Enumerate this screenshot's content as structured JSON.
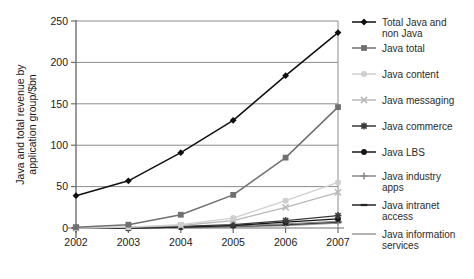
{
  "chart_data": {
    "type": "line",
    "title": "",
    "xlabel": "",
    "ylabel": "Java and total revenue by application group/$bn",
    "categories": [
      "2002",
      "2003",
      "2004",
      "2005",
      "2006",
      "2007"
    ],
    "x": [
      2002,
      2003,
      2004,
      2005,
      2006,
      2007
    ],
    "ylim": [
      0,
      250
    ],
    "yticks": [
      0,
      50,
      100,
      150,
      200,
      250
    ],
    "ytick_labels": [
      "0",
      "50",
      "100",
      "150",
      "200",
      "250"
    ],
    "grid": true,
    "grid_axis": "y",
    "legend_position": "right",
    "series": [
      {
        "name": "Total Java and non Java",
        "label_lines": [
          "Total Java and",
          "non Java"
        ],
        "marker": "diamond",
        "color": "#101010",
        "values": [
          39,
          57,
          91,
          130,
          184,
          236
        ]
      },
      {
        "name": "Java total",
        "label_lines": [
          "Java total"
        ],
        "marker": "square",
        "color": "#707070",
        "values": [
          1,
          4,
          16,
          40,
          85,
          146
        ]
      },
      {
        "name": "Java content",
        "label_lines": [
          "Java content"
        ],
        "marker": "circle",
        "color": "#cfcfcf",
        "values": [
          0,
          1,
          4,
          12,
          33,
          55
        ]
      },
      {
        "name": "Java messaging",
        "label_lines": [
          "Java messaging"
        ],
        "marker": "x",
        "color": "#b8b8b8",
        "values": [
          0,
          1,
          3,
          9,
          25,
          43
        ]
      },
      {
        "name": "Java commerce",
        "label_lines": [
          "Java commerce"
        ],
        "marker": "star",
        "color": "#3a3a3a",
        "values": [
          0,
          0,
          2,
          4,
          9,
          15
        ]
      },
      {
        "name": "Java LBS",
        "label_lines": [
          "Java LBS"
        ],
        "marker": "dot",
        "color": "#161616",
        "values": [
          0,
          0,
          1,
          3,
          7,
          11
        ]
      },
      {
        "name": "Java industry apps",
        "label_lines": [
          "Java industry",
          "apps"
        ],
        "marker": "plus",
        "color": "#8a8a8a",
        "values": [
          0,
          0,
          1,
          2,
          5,
          8
        ]
      },
      {
        "name": "Java intranet access",
        "label_lines": [
          "Java intranet",
          "access"
        ],
        "marker": "dash",
        "color": "#242424",
        "values": [
          0,
          0,
          1,
          2,
          4,
          7
        ]
      },
      {
        "name": "Java information services",
        "label_lines": [
          "Java information",
          "services"
        ],
        "marker": "line",
        "color": "#9a9a9a",
        "values": [
          0,
          0,
          0,
          1,
          3,
          6
        ]
      }
    ]
  },
  "axes": {
    "y_axis_title": "Java and total revenue by application group/$bn",
    "y_tick_labels": [
      "250",
      "200",
      "150",
      "100",
      "50",
      "0"
    ],
    "x_tick_labels": [
      "2002",
      "2003",
      "2004",
      "2005",
      "2006",
      "2007"
    ]
  },
  "legend": {
    "entries": [
      {
        "label": "Total Java and non Java",
        "line1": "Total Java and",
        "line2": "non Java"
      },
      {
        "label": "Java total",
        "line1": "Java total",
        "line2": ""
      },
      {
        "label": "Java content",
        "line1": "Java content",
        "line2": ""
      },
      {
        "label": "Java messaging",
        "line1": "Java messaging",
        "line2": ""
      },
      {
        "label": "Java commerce",
        "line1": "Java commerce",
        "line2": ""
      },
      {
        "label": "Java LBS",
        "line1": "Java LBS",
        "line2": ""
      },
      {
        "label": "Java industry apps",
        "line1": "Java industry",
        "line2": "apps"
      },
      {
        "label": "Java intranet access",
        "line1": "Java intranet",
        "line2": "access"
      },
      {
        "label": "Java information services",
        "line1": "Java information",
        "line2": "services"
      }
    ]
  },
  "colors": {
    "background": "#ffffff",
    "grid": "#8c8c8c",
    "axis": "#6e6e6e",
    "text": "#1a1a1a"
  }
}
